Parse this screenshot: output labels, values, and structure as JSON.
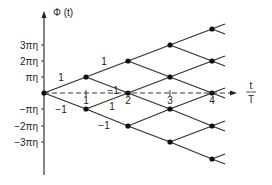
{
  "diagram": {
    "y_axis_label": "Φ (t)",
    "x_axis_label_num": "t",
    "x_axis_label_den": "T",
    "y_ticks": [
      {
        "label": "3πη",
        "value": 3
      },
      {
        "label": "2πη",
        "value": 2
      },
      {
        "label": "πη",
        "value": 1
      },
      {
        "label": "−πη",
        "value": -1
      },
      {
        "label": "−2πη",
        "value": -2
      },
      {
        "label": "−3πη",
        "value": -3
      }
    ],
    "x_ticks": [
      {
        "label": "1",
        "value": 1
      },
      {
        "label": "2",
        "value": 2
      },
      {
        "label": "3",
        "value": 3
      },
      {
        "label": "4",
        "value": 4
      }
    ],
    "edge_labels": [
      {
        "label": "1",
        "from": "t0:0",
        "to": "t1:+1"
      },
      {
        "label": "−1",
        "from": "t0:0",
        "to": "t1:-1"
      },
      {
        "label": "1",
        "from": "t1:+1",
        "to": "t2:+2"
      },
      {
        "label": "−1",
        "from": "t1:+1",
        "to": "t2:0"
      },
      {
        "label": "1",
        "from": "t1:-1",
        "to": "t2:0"
      },
      {
        "label": "−1",
        "from": "t1:-1",
        "to": "t2:-2"
      }
    ],
    "nodes": [
      {
        "t": 0,
        "phase": 0
      },
      {
        "t": 1,
        "phase": 1
      },
      {
        "t": 1,
        "phase": -1
      },
      {
        "t": 2,
        "phase": 2
      },
      {
        "t": 2,
        "phase": 0
      },
      {
        "t": 2,
        "phase": -2
      },
      {
        "t": 3,
        "phase": 3
      },
      {
        "t": 3,
        "phase": 1
      },
      {
        "t": 3,
        "phase": -1
      },
      {
        "t": 3,
        "phase": -3
      },
      {
        "t": 4,
        "phase": 4
      },
      {
        "t": 4,
        "phase": 2
      },
      {
        "t": 4,
        "phase": 0
      },
      {
        "t": 4,
        "phase": -2
      },
      {
        "t": 4,
        "phase": -4
      }
    ]
  }
}
